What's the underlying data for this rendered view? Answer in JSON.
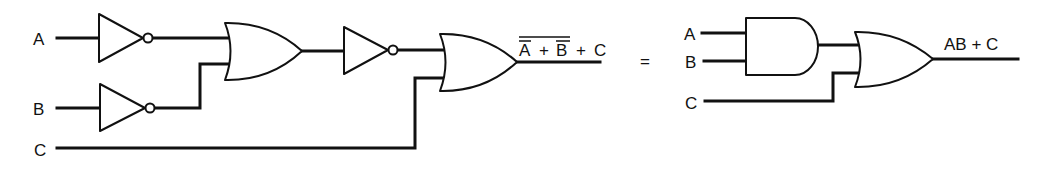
{
  "diagram": {
    "type": "logic-circuit-equivalence",
    "colors": {
      "ink": "#111111",
      "background": "#ffffff"
    },
    "left_circuit": {
      "inputs": [
        "A",
        "B",
        "C"
      ],
      "gates": [
        {
          "id": "not-a",
          "kind": "NOT",
          "input": "A"
        },
        {
          "id": "not-b",
          "kind": "NOT",
          "input": "B"
        },
        {
          "id": "or-1",
          "kind": "OR",
          "inputs": [
            "not-a",
            "not-b"
          ]
        },
        {
          "id": "not-or",
          "kind": "NOT",
          "input": "or-1"
        },
        {
          "id": "or-2",
          "kind": "OR",
          "inputs": [
            "not-or",
            "C"
          ]
        }
      ],
      "output_label": {
        "A": "A",
        "plus1": "+",
        "B": "B",
        "plus2": "+",
        "C": "C"
      },
      "output_expression": "NOT(NOT A + NOT B) + C"
    },
    "equals_sign": "=",
    "right_circuit": {
      "inputs": [
        "A",
        "B",
        "C"
      ],
      "gates": [
        {
          "id": "and-1",
          "kind": "AND",
          "inputs": [
            "A",
            "B"
          ]
        },
        {
          "id": "or-3",
          "kind": "OR",
          "inputs": [
            "and-1",
            "C"
          ]
        }
      ],
      "output_label": "AB + C"
    }
  }
}
